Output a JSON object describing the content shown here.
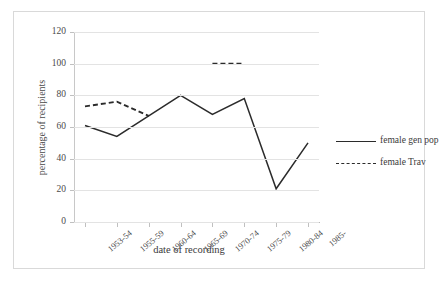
{
  "chart_data": {
    "type": "line",
    "title": "",
    "xlabel": "date of recording",
    "ylabel": "percentage of recipients",
    "categories": [
      "1953-54",
      "1955-59",
      "1960-64",
      "1965-69",
      "1970-74",
      "1975-79",
      "1980-84",
      "1985-"
    ],
    "ylim": [
      0,
      120
    ],
    "yticks": [
      0,
      20,
      40,
      60,
      80,
      100,
      120
    ],
    "grid": "horizontal",
    "legend_position": "right",
    "series": [
      {
        "name": "female gen pop",
        "style": "solid",
        "color": "#2b2b2b",
        "values": [
          61,
          54,
          67,
          80,
          68,
          78,
          21,
          50
        ]
      },
      {
        "name": "female Trav",
        "style": "dashed",
        "color": "#2b2b2b",
        "values": [
          73,
          76,
          67,
          null,
          100,
          100,
          null,
          null
        ]
      }
    ]
  },
  "axes": {
    "y_title": "percentage of recipients",
    "x_title": "date of recording",
    "y_tick_labels": [
      "0",
      "20",
      "40",
      "60",
      "80",
      "100",
      "120"
    ],
    "x_tick_labels": [
      "1953-54",
      "1955-59",
      "1960-64",
      "1965-69",
      "1970-74",
      "1975-79",
      "1980-84",
      "1985-"
    ]
  },
  "legend": {
    "items": [
      {
        "label": "female gen pop",
        "style": "solid"
      },
      {
        "label": "female Trav",
        "style": "dashed"
      }
    ]
  },
  "colors": {
    "line": "#2b2b2b",
    "grid": "#e3e3e3",
    "frame": "#d9d9d9",
    "text": "#3a3a3a"
  }
}
